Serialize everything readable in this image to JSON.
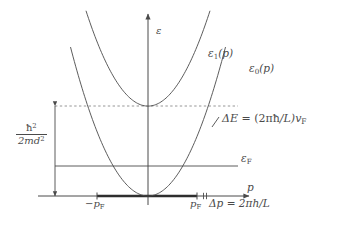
{
  "figure": {
    "background_color": "#ffffff",
    "line_color": "#4a4a4a",
    "axis_color": "#4a4a4a",
    "dashed_color": "#8a8a8a"
  },
  "axes": {
    "vertical_label": "ε",
    "horizontal_label": "p",
    "origin_px": {
      "x": 148,
      "y": 196
    }
  },
  "curves": {
    "ground": {
      "label_prefix": "ε",
      "label_sub": "0",
      "label_suffix": "(p)",
      "label_full": "ε0(p)"
    },
    "excited": {
      "label_prefix": "ε",
      "label_sub": "1",
      "label_suffix": "(p)",
      "label_full": "ε1(p)"
    }
  },
  "annotations": {
    "delta_e": {
      "lhs": "ΔE",
      "equals": "=",
      "rhs_open": "(2π",
      "rhs_hbar": "ħ",
      "rhs_over_l": "/L)",
      "rhs_v": "v",
      "rhs_v_sub": "F",
      "full": "ΔE = (2πħ/L)vF"
    },
    "fermi_energy": {
      "symbol": "ε",
      "subscript": "F",
      "full": "εF"
    },
    "energy_scale": {
      "numerator_base": "ħ",
      "numerator_exp": "2",
      "denominator_base": "2md",
      "denominator_exp": "2",
      "full": "ħ2 / 2md2"
    },
    "delta_p": {
      "lhs": "Δp",
      "equals": "=",
      "rhs": "2πh/L",
      "full": "Δp = 2πh/L"
    }
  },
  "ticks": {
    "neg_pf": {
      "symbol": "−p",
      "subscript": "F",
      "full": "−pF",
      "x_px": 97
    },
    "pos_pf": {
      "symbol": "p",
      "subscript": "F",
      "full": "pF",
      "x_px": 197
    },
    "delta_p_mark_x_px": 205
  },
  "chart_data": {
    "type": "line",
    "xlabel": "p",
    "ylabel": "ε",
    "grid": false,
    "legend": "inline curve labels",
    "xlim": [
      -1.55,
      1.55
    ],
    "ylim": [
      0,
      2.35
    ],
    "series": [
      {
        "name": "ε0(p)",
        "description": "ground-state parabola with vertex at the origin",
        "vertex": {
          "p": 0,
          "epsilon": 0
        },
        "curvature": 1.0,
        "x": [
          -1.5,
          -1.25,
          -1.0,
          -0.75,
          -0.5,
          -0.25,
          0,
          0.25,
          0.5,
          0.75,
          1.0,
          1.25,
          1.5
        ],
        "y": [
          2.25,
          1.5625,
          1.0,
          0.5625,
          0.25,
          0.0625,
          0,
          0.0625,
          0.25,
          0.5625,
          1.0,
          1.5625,
          2.25
        ]
      },
      {
        "name": "ε1(p)",
        "description": "excited-state parabola shifted up by the subband energy",
        "vertex": {
          "p": 0,
          "epsilon": 1.45
        },
        "curvature": 1.0,
        "x": [
          -1.5,
          -1.25,
          -1.0,
          -0.75,
          -0.5,
          -0.25,
          0,
          0.25,
          0.5,
          0.75,
          1.0,
          1.25,
          1.5
        ],
        "y": [
          3.7,
          3.0125,
          2.45,
          2.0125,
          1.7,
          1.5125,
          1.45,
          1.5125,
          1.7,
          2.0125,
          2.45,
          3.0125,
          3.7
        ]
      }
    ],
    "reference_lines": [
      {
        "name": "εF",
        "type": "horizontal",
        "value": 0.52,
        "style": "solid"
      },
      {
        "name": "subband bottom",
        "type": "horizontal",
        "value": 1.45,
        "style": "dashed"
      }
    ],
    "markers": [
      {
        "name": "−pF",
        "type": "x-tick",
        "value": -1.0
      },
      {
        "name": "pF",
        "type": "x-tick",
        "value": 1.0
      },
      {
        "name": "Δp",
        "type": "x-tick",
        "value": 1.16
      }
    ],
    "measures": [
      {
        "name": "ħ2/2md2",
        "type": "vertical-span",
        "from": 0,
        "to": 1.45
      },
      {
        "name": "ΔE = (2πħ/L)vF",
        "type": "point-annotation",
        "at_curve": "ε0(p)"
      }
    ]
  }
}
